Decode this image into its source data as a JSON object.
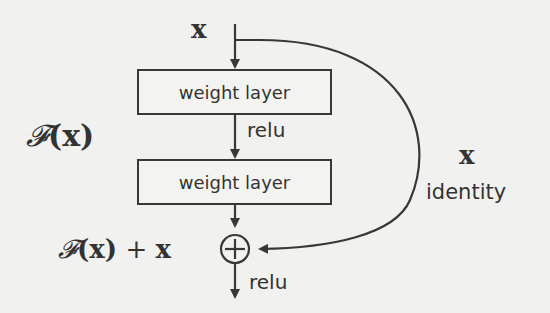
{
  "diagram": {
    "input_label": "x",
    "layers": [
      {
        "label": "weight layer"
      },
      {
        "label": "weight layer"
      }
    ],
    "activation_between": "relu",
    "activation_after_sum": "relu",
    "residual_function_label": "𝓕(x)",
    "residual_function_script": "𝓕",
    "residual_function_arg": "(x)",
    "output_label": "𝓕(x) + x",
    "output_label_parts": {
      "f": "𝓕",
      "arg": "(x)",
      "plus": "+",
      "x": "x"
    },
    "shortcut_variable": "x",
    "shortcut_label": "identity",
    "sum_symbol": "+"
  },
  "colors": {
    "background": "#f1f1ef",
    "stroke": "#383838",
    "text": "#333333"
  }
}
